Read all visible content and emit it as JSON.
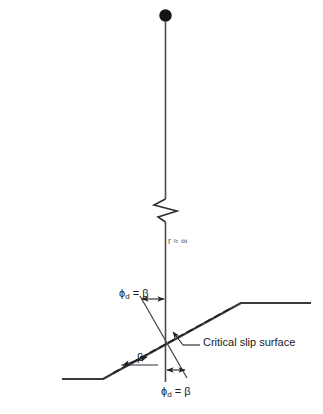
{
  "figure": {
    "type": "geotechnical-slope-stability-diagram",
    "background_color": "#ffffff",
    "line_color": "#333333",
    "text_color": "#1a1a1a",
    "labels": {
      "radius": "r ≈ ∞",
      "phi_top_symbol": "ϕ",
      "phi_top_subscript": "d",
      "phi_top_rest": " = β",
      "phi_bottom_symbol": "ϕ",
      "phi_bottom_subscript": "d",
      "phi_bottom_rest": " = β",
      "beta": "β",
      "critical_slip_surface": "Critical slip surface"
    },
    "elements": {
      "center_dot": "circle-marker",
      "radius_line": "vertical-radius-line",
      "break_symbol": "zigzag-break",
      "ground_surface": "slope-ground-profile",
      "slip_surface": "dashed-critical-slip-surface",
      "beta_arc": "beta-angle-arc",
      "phi_top_arc": "phi-d-top-angle-arc",
      "phi_bottom_arc": "phi-d-bottom-angle-arc",
      "leader_slip": "leader-line-critical-slip-surface",
      "leader_phi_top": "leader-line-phi-top"
    }
  }
}
